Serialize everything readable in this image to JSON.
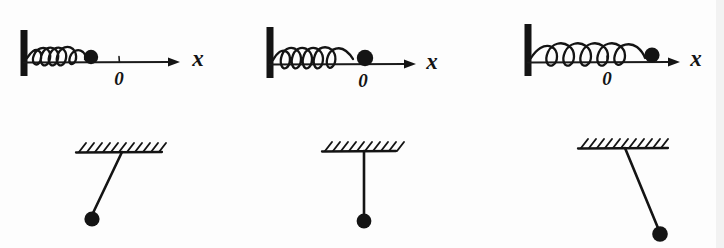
{
  "figure": {
    "background_color": "#fdfdfd",
    "ink_color": "#141414",
    "width": 724,
    "height": 248,
    "style": "hand-drawn ink sketch"
  },
  "rows": [
    {
      "name": "spring-mass-row",
      "description": "Horizontal spring attached to a fixed wall with a mass sliding along the x axis"
    },
    {
      "name": "pendulum-row",
      "description": "Simple pendulum suspended from a hatched ceiling"
    }
  ],
  "spring_panels": [
    {
      "id": "spring-panel-1",
      "state": "compressed",
      "mass_position": "left of origin",
      "coil_count": 5,
      "axis_label": "x",
      "origin_label": "0",
      "wall": {
        "x": 24,
        "y_top": 30,
        "y_bottom": 76,
        "thickness": 7
      },
      "axis": {
        "x_start": 24,
        "x_end": 176,
        "y": 62
      },
      "arrow_tip_x": 176,
      "origin_x": 119,
      "mass": {
        "cx": 91,
        "cy": 57,
        "r": 7.2
      },
      "spring": {
        "x_start": 30,
        "x_end": 86,
        "baseline_y": 60,
        "amplitude": 15
      },
      "label_x_pos": {
        "x": 198,
        "y": 64
      },
      "label_zero_pos": {
        "x": 119,
        "y": 84
      }
    },
    {
      "id": "spring-panel-2",
      "state": "natural length / equilibrium",
      "mass_position": "at origin",
      "coil_count": 5,
      "axis_label": "x",
      "origin_label": "0",
      "wall": {
        "x": 270,
        "y_top": 27,
        "y_bottom": 78,
        "thickness": 7
      },
      "axis": {
        "x_start": 270,
        "x_end": 412,
        "y": 64
      },
      "arrow_tip_x": 412,
      "origin_x": 363,
      "mass": {
        "cx": 365,
        "cy": 58,
        "r": 8.2
      },
      "spring": {
        "x_start": 276,
        "x_end": 358,
        "baseline_y": 62,
        "amplitude": 16
      },
      "label_x_pos": {
        "x": 432,
        "y": 67
      },
      "label_zero_pos": {
        "x": 363,
        "y": 86
      }
    },
    {
      "id": "spring-panel-3",
      "state": "stretched",
      "mass_position": "right of origin",
      "coil_count": 6,
      "axis_label": "x",
      "origin_label": "0",
      "wall": {
        "x": 528,
        "y_top": 24,
        "y_bottom": 76,
        "thickness": 7
      },
      "axis": {
        "x_start": 528,
        "x_end": 676,
        "y": 62
      },
      "arrow_tip_x": 676,
      "origin_x": 607,
      "mass": {
        "cx": 652,
        "cy": 55,
        "r": 7.6
      },
      "spring": {
        "x_start": 534,
        "x_end": 646,
        "baseline_y": 59,
        "amplitude": 17
      },
      "label_x_pos": {
        "x": 696,
        "y": 64
      },
      "label_zero_pos": {
        "x": 607,
        "y": 84
      }
    }
  ],
  "pendulum_panels": [
    {
      "id": "pendulum-panel-1",
      "state": "displaced left",
      "ceiling": {
        "x_start": 76,
        "x_end": 162,
        "y": 152
      },
      "hatch_count": 11,
      "pivot": {
        "x": 122,
        "y": 152
      },
      "bob": {
        "cx": 92,
        "cy": 219,
        "r": 7.6
      }
    },
    {
      "id": "pendulum-panel-2",
      "state": "vertical / equilibrium",
      "ceiling": {
        "x_start": 322,
        "x_end": 396,
        "y": 151
      },
      "hatch_count": 10,
      "pivot": {
        "x": 364,
        "y": 151
      },
      "bob": {
        "cx": 364,
        "cy": 221,
        "r": 7.4
      }
    },
    {
      "id": "pendulum-panel-3",
      "state": "displaced right",
      "ceiling": {
        "x_start": 578,
        "x_end": 668,
        "y": 148
      },
      "hatch_count": 11,
      "pivot": {
        "x": 625,
        "y": 148
      },
      "bob": {
        "cx": 660,
        "cy": 234,
        "r": 7.8
      }
    }
  ],
  "labels": {
    "axis_x": "x",
    "origin": "0"
  }
}
